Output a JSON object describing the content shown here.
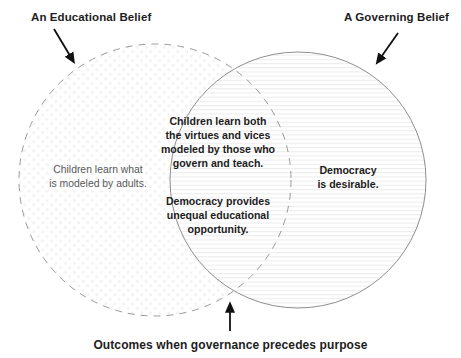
{
  "diagram": {
    "type": "venn-2-circle",
    "title_top_left": "An Educational Belief",
    "title_top_right": "A Governing Belief",
    "caption": "Outcomes when governance precedes purpose",
    "left_circle": {
      "label": "An Educational Belief",
      "text": "Children learn what\nis modeled by adults.",
      "border_style": "dashed",
      "border_color": "#9a9a9a",
      "fill_pattern": "dots",
      "fill_color": "#f3f3f3"
    },
    "right_circle": {
      "label": "A Governing Belief",
      "text": "Democracy\nis desirable.",
      "border_style": "solid",
      "border_color": "#8f8f8f",
      "fill_pattern": "horizontal-lines",
      "fill_color": "#ededed"
    },
    "overlap": {
      "paragraphs": [
        "Children learn both\nthe virtues and vices\nmodeled by those who\ngovern and teach.",
        "Democracy provides\nunequal educational\nopportunity."
      ]
    },
    "arrows": [
      {
        "name": "arrow-to-left-circle",
        "direction": "down-right"
      },
      {
        "name": "arrow-to-right-circle",
        "direction": "down-left"
      },
      {
        "name": "arrow-to-overlap-bottom",
        "direction": "up"
      }
    ],
    "colors": {
      "text_dark": "#1d1d1d",
      "text_muted": "#595959",
      "stroke_gray": "#9a9a9a",
      "arrow_black": "#111111",
      "background": "#ffffff"
    }
  }
}
